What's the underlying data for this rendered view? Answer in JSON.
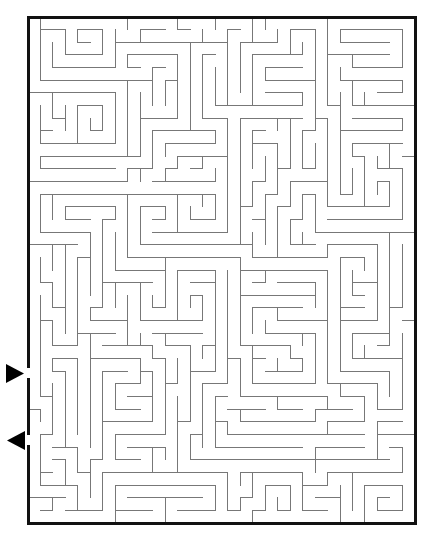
{
  "puzzle": {
    "kind": "maze",
    "title": "Rectangular Maze Puzzle",
    "background_color": "#ffffff",
    "canvas": {
      "width": 431,
      "height": 545
    }
  },
  "maze": {
    "grid": {
      "cols": 31,
      "rows": 40
    },
    "geometry": {
      "origin_x": 28,
      "origin_y": 17,
      "cell_width": 12.48,
      "cell_height": 12.65,
      "width": 387,
      "height": 506
    },
    "border": {
      "color": "#111111",
      "thickness": 3,
      "label": "maze-outer-border"
    },
    "walls": {
      "color": "#777777",
      "thickness": 1,
      "label": "maze-interior-walls"
    },
    "openings": [
      {
        "name": "entrance",
        "side": "left",
        "row": 28,
        "y_center": 373,
        "gap_height": 13
      },
      {
        "name": "exit",
        "side": "left",
        "row": 33,
        "y_center": 440,
        "gap_height": 13
      }
    ],
    "markers": [
      {
        "name": "entrance-arrow",
        "direction": "right",
        "points": "6,364 6,383 24,373.5",
        "color": "#000000",
        "tip_x": 24,
        "tip_y": 373.5
      },
      {
        "name": "exit-arrow",
        "direction": "left",
        "points": "25,431 25,450 7,440.5",
        "color": "#000000",
        "tip_x": 7,
        "tip_y": 440.5
      }
    ],
    "seed": 20240731,
    "corridor_bias": 0.55
  }
}
